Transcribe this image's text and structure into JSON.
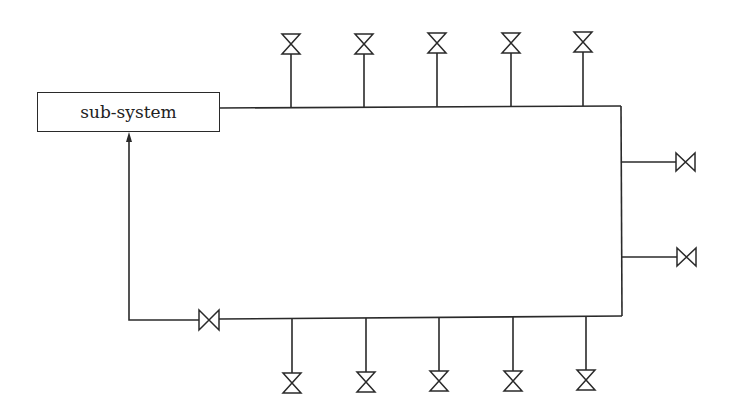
{
  "diagram": {
    "title": "",
    "subsystem_label": "sub-system",
    "line_color": "#2a2a2a",
    "top_valves_x": [
      291,
      364,
      437,
      511,
      583
    ],
    "bottom_valves_x": [
      292,
      366,
      439,
      513,
      586
    ],
    "right_valves_y": [
      162,
      257
    ],
    "return_valve": {
      "x": 209,
      "y": 320
    }
  }
}
